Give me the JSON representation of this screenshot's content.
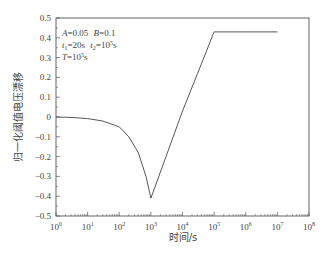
{
  "chart_data": {
    "type": "line",
    "title": "",
    "xlabel": "时间/s",
    "ylabel": "归一化阈值电压漂移",
    "xscale": "log",
    "xlim": [
      1,
      100000000
    ],
    "ylim": [
      -0.5,
      0.5
    ],
    "grid": false,
    "legend": null,
    "x_ticks": [
      "10^0",
      "10^1",
      "10^2",
      "10^3",
      "10^4",
      "10^5",
      "10^6",
      "10^7",
      "10^8"
    ],
    "y_ticks": [
      "0.5",
      "0.4",
      "0.3",
      "0.2",
      "0.1",
      "0",
      "-0.1",
      "-0.2",
      "-0.3",
      "-0.4",
      "-0.5"
    ],
    "annotations": [
      "A=0.05  B=0.1",
      "t1=20s  t2=10^5s",
      "T=10^5s"
    ],
    "series": [
      {
        "name": "normalized threshold voltage shift",
        "x": [
          1,
          3,
          10,
          30,
          100,
          200,
          400,
          700,
          1000,
          3000,
          10000,
          30000,
          100000,
          1000000,
          10000000
        ],
        "y": [
          0,
          -0.002,
          -0.008,
          -0.02,
          -0.05,
          -0.1,
          -0.18,
          -0.3,
          -0.41,
          -0.2,
          0.03,
          0.22,
          0.43,
          0.43,
          0.43
        ]
      }
    ]
  },
  "labels": {
    "xlabel": "时间/s",
    "ylabel": "归一化阈值电压漂移",
    "annot1_A": "A",
    "annot1_A_val": "=0.05",
    "annot1_B": "B",
    "annot1_B_val": "=0.1",
    "annot2_t1": "t",
    "annot2_t1_sub": "1",
    "annot2_t1_val": "=20s",
    "annot2_t2": "t",
    "annot2_t2_sub": "2",
    "annot2_t2_val": "=10",
    "annot2_t2_exp": "5",
    "annot2_t2_unit": "s",
    "annot3_T": "T",
    "annot3_T_val": "=10",
    "annot3_T_exp": "5",
    "annot3_T_unit": "s"
  },
  "colors": {
    "line": "#444444",
    "axis": "#555555"
  }
}
